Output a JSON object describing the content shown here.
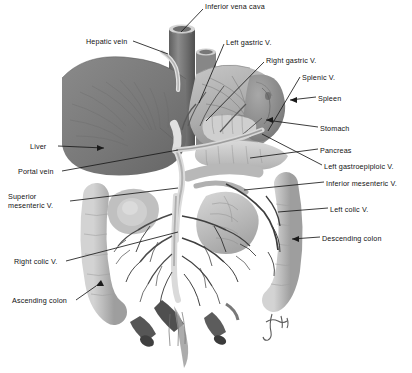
{
  "figure": {
    "background_color": "#ffffff",
    "width": 412,
    "height": 373,
    "style": "grayscale medical illustration"
  },
  "labels": [
    {
      "id": "inferior-vena-cava",
      "text": "Inferior vena cava",
      "x": 205,
      "y": 3,
      "anchor": "left"
    },
    {
      "id": "hepatic-vein",
      "text": "Hepatic vein",
      "x": 86,
      "y": 38,
      "anchor": "left"
    },
    {
      "id": "left-gastric-v",
      "text": "Left gastric  V.",
      "x": 226,
      "y": 39,
      "anchor": "left"
    },
    {
      "id": "right-gastric-v",
      "text": "Right gastric  V.",
      "x": 266,
      "y": 57,
      "anchor": "left"
    },
    {
      "id": "splenic-v",
      "text": "Splenic  V.",
      "x": 302,
      "y": 74,
      "anchor": "left"
    },
    {
      "id": "spleen",
      "text": "Spleen",
      "x": 318,
      "y": 95,
      "anchor": "left"
    },
    {
      "id": "stomach",
      "text": "Stomach",
      "x": 320,
      "y": 125,
      "anchor": "left"
    },
    {
      "id": "pancreas",
      "text": "Pancreas",
      "x": 320,
      "y": 147,
      "anchor": "left"
    },
    {
      "id": "left-gastroepiploic-v",
      "text": "Left gastroepiploic  V.",
      "x": 324,
      "y": 163,
      "anchor": "left"
    },
    {
      "id": "inferior-mesenteric-v",
      "text": "Inferior mesenteric  V.",
      "x": 326,
      "y": 180,
      "anchor": "left"
    },
    {
      "id": "left-colic-v",
      "text": "Left colic  V.",
      "x": 330,
      "y": 206,
      "anchor": "left"
    },
    {
      "id": "descending-colon",
      "text": "Descending colon",
      "x": 322,
      "y": 235,
      "anchor": "left"
    },
    {
      "id": "liver",
      "text": "Liver",
      "x": 30,
      "y": 143,
      "anchor": "left"
    },
    {
      "id": "portal-vein",
      "text": "Portal vein",
      "x": 18,
      "y": 168,
      "anchor": "left"
    },
    {
      "id": "superior-mesenteric-v",
      "text": "Superior mesenteric  V.",
      "x": 8,
      "y": 197,
      "anchor": "left",
      "two_line": true
    },
    {
      "id": "right-colic-v",
      "text": "Right colic  V.",
      "x": 14,
      "y": 258,
      "anchor": "left"
    },
    {
      "id": "ascending-colon",
      "text": "Ascending colon",
      "x": 12,
      "y": 297,
      "anchor": "left"
    }
  ],
  "signature": {
    "text": "",
    "x": 262,
    "y": 318
  },
  "colors": {
    "liver": "#7c7c7c",
    "liver_dark": "#6a6a6a",
    "vessel": "#6f6f6f",
    "vessel_dark": "#4e4e4e",
    "organ_light": "#c9c9c9",
    "organ_mid": "#aeaeae",
    "stomach": "#b4b4b4",
    "spleen": "#8f8f8f",
    "colon": "#bdbdbd",
    "leader_line": "#1a1a1a",
    "text": "#111111"
  }
}
